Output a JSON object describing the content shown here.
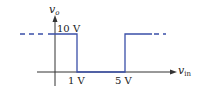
{
  "diagram": {
    "type": "transfer-characteristic",
    "y_axis_label_main": "v",
    "y_axis_label_sub": "o",
    "x_axis_label_main": "v",
    "x_axis_label_sub": "in",
    "high_level_label": "10 V",
    "threshold_low_label": "1 V",
    "threshold_high_label": "5 V",
    "curve_color": "#3a4fa8",
    "axis_color": "#333333",
    "segments": [
      {
        "from_vin": "-inf",
        "to_vin": 1,
        "vo": 10
      },
      {
        "from_vin": 1,
        "to_vin": 5,
        "vo": 0
      },
      {
        "from_vin": 5,
        "to_vin": "inf",
        "vo": 10
      }
    ]
  }
}
